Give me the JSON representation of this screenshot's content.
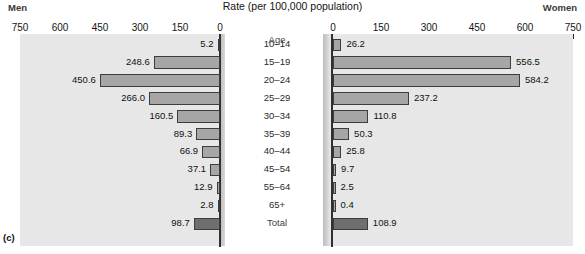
{
  "figure": {
    "caption": "(c)",
    "title": "Rate (per 100,000 population)",
    "left_header": "Men",
    "right_header": "Women",
    "age_column_header": "Age"
  },
  "axes": {
    "left_ticks": [
      "750",
      "600",
      "450",
      "300",
      "150",
      "0"
    ],
    "right_ticks": [
      "0",
      "150",
      "300",
      "450",
      "600",
      "750"
    ],
    "max": 750,
    "tick_step": 150
  },
  "colors": {
    "bar_fill": "#a6a6a6",
    "bar_total_fill": "#6f6f6f",
    "bar_stroke": "#3d3d3d",
    "panel_bg": "#e7e7e7",
    "axis": "#2a2a2a",
    "text": "#141414"
  },
  "chart_data": {
    "type": "bar",
    "title": "Rate (per 100,000 population)",
    "xlabel": "Rate (per 100,000 population)",
    "ylabel": "Age",
    "orientation": "horizontal",
    "layout": "back-to-back population pyramid",
    "xlim": [
      0,
      750
    ],
    "xticks": [
      0,
      150,
      300,
      450,
      600,
      750
    ],
    "grid": false,
    "legend": "none",
    "categories": [
      "10–14",
      "15–19",
      "20–24",
      "25–29",
      "30–34",
      "35–39",
      "40–44",
      "45–54",
      "55–64",
      "65+",
      "Total"
    ],
    "series": [
      {
        "name": "Men",
        "side": "left",
        "values": [
          5.2,
          248.6,
          450.6,
          266.0,
          160.5,
          89.3,
          66.9,
          37.1,
          12.9,
          2.8,
          98.7
        ],
        "labels": [
          "5.2",
          "248.6",
          "450.6",
          "266.0",
          "160.5",
          "89.3",
          "66.9",
          "37.1",
          "12.9",
          "2.8",
          "98.7"
        ]
      },
      {
        "name": "Women",
        "side": "right",
        "values": [
          26.2,
          556.5,
          584.2,
          237.2,
          110.8,
          50.3,
          25.8,
          9.7,
          2.5,
          0.4,
          108.9
        ],
        "labels": [
          "26.2",
          "556.5",
          "584.2",
          "237.2",
          "110.8",
          "50.3",
          "25.8",
          "9.7",
          "2.5",
          "0.4",
          "108.9"
        ]
      }
    ]
  }
}
